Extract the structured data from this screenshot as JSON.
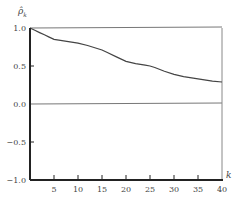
{
  "chart_data": {
    "type": "line",
    "title": "",
    "xlabel": "k",
    "ylabel": "ρ̂_k",
    "xlim": [
      0,
      40
    ],
    "ylim": [
      -1.0,
      1.0
    ],
    "xticks": [
      5,
      10,
      15,
      20,
      25,
      30,
      35,
      40
    ],
    "xtick_labels": [
      "5",
      "10",
      "15",
      "20",
      "25",
      "30",
      "35",
      "40"
    ],
    "yticks": [
      1.0,
      0.5,
      0.0,
      -0.5,
      -1.0
    ],
    "ytick_labels": [
      "1.0",
      "0.5",
      "0.0",
      "−0.5",
      "−1.0"
    ],
    "grid": false,
    "reference_lines": [
      {
        "y": 1.0
      },
      {
        "y": 0.0
      }
    ],
    "series": [
      {
        "name": "sample autocorrelation",
        "x": [
          0,
          1,
          2,
          3,
          4,
          5,
          6,
          7,
          8,
          9,
          10,
          12,
          14,
          15,
          16,
          18,
          20,
          22,
          24,
          25,
          26,
          28,
          30,
          32,
          34,
          35,
          36,
          38,
          40
        ],
        "values": [
          1.0,
          0.97,
          0.94,
          0.91,
          0.88,
          0.85,
          0.84,
          0.83,
          0.82,
          0.81,
          0.8,
          0.77,
          0.73,
          0.71,
          0.68,
          0.62,
          0.56,
          0.53,
          0.51,
          0.5,
          0.48,
          0.43,
          0.39,
          0.36,
          0.34,
          0.33,
          0.32,
          0.3,
          0.29
        ]
      }
    ]
  }
}
